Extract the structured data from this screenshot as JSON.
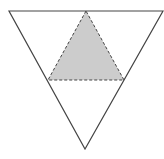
{
  "diagram": {
    "title": "",
    "outer_triangle": {
      "orientation": "inverted",
      "vertices": [
        [
          9,
          11
        ],
        [
          163,
          11
        ],
        [
          85,
          149
        ]
      ],
      "stroke": "#444444",
      "fill": "none"
    },
    "inner_triangle": {
      "orientation": "upright",
      "vertices": [
        [
          86,
          11
        ],
        [
          48,
          80
        ],
        [
          124,
          80
        ]
      ],
      "stroke": "#444444",
      "stroke_style": "dashed",
      "fill": "#cccccc"
    },
    "labels": []
  }
}
